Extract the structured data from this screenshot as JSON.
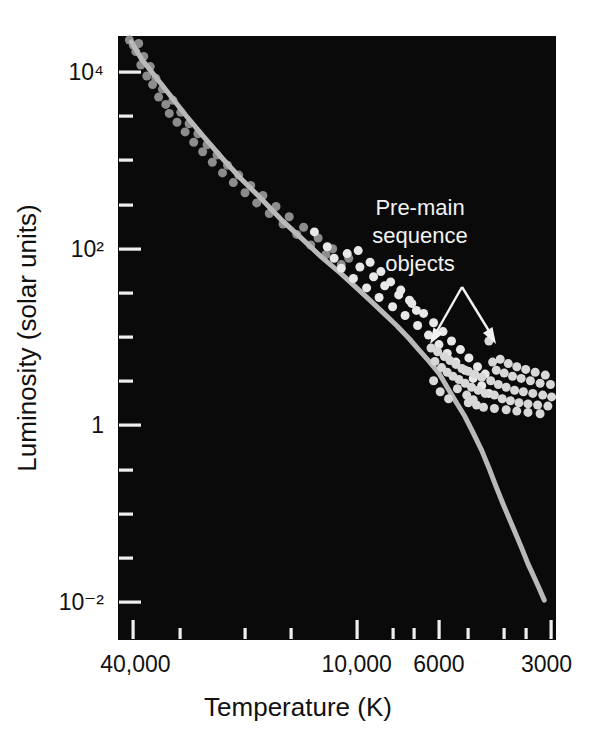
{
  "figure": {
    "background": "#ffffff",
    "plot_background": "#0a0a0a",
    "plot_border": "#0a0a0a"
  },
  "chart_data": {
    "type": "scatter",
    "title": "",
    "xlabel": "Temperature (K)",
    "ylabel": "Luminosity (solar units)",
    "xscale": "log-reversed",
    "yscale": "log",
    "xlim": [
      44000,
      2900
    ],
    "ylim": [
      0.005,
      30000
    ],
    "grid": false,
    "legend": false,
    "x_ticklabels": [
      "40,000",
      "10,000",
      "6000",
      "3000"
    ],
    "x_ticklabel_values": [
      40000,
      10000,
      6000,
      3000
    ],
    "x_minor_ticks": [
      30000,
      20000,
      15000,
      8000,
      7000,
      5000,
      4000,
      3500
    ],
    "y_ticklabels": [
      "10⁴",
      "10²",
      "1",
      "10⁻²"
    ],
    "y_ticklabel_values": [
      10000,
      100,
      1,
      0.01
    ],
    "y_minor_decades": [
      1000,
      10,
      0.1,
      0.001
    ],
    "annotations": [
      {
        "name": "pre-main-sequence-objects",
        "lines": [
          "Pre-main",
          "sequence",
          "objects"
        ],
        "color": "#f2f2f2",
        "arrows": 2
      }
    ],
    "series": [
      {
        "name": "main-sequence",
        "type": "line",
        "color": "#b9b9b9",
        "width": 5,
        "points": [
          [
            40500,
            22000
          ],
          [
            38000,
            14000
          ],
          [
            35000,
            9000
          ],
          [
            32000,
            5600
          ],
          [
            29000,
            3300
          ],
          [
            26000,
            1900
          ],
          [
            23000,
            1050
          ],
          [
            20500,
            620
          ],
          [
            18000,
            360
          ],
          [
            16000,
            215
          ],
          [
            14000,
            128
          ],
          [
            12500,
            82
          ],
          [
            11000,
            52
          ],
          [
            10000,
            36
          ],
          [
            9200,
            26
          ],
          [
            8500,
            19
          ],
          [
            7800,
            13.5
          ],
          [
            7200,
            9.5
          ],
          [
            6800,
            7.2
          ],
          [
            6400,
            5.4
          ],
          [
            6000,
            3.9
          ],
          [
            5700,
            2.7
          ],
          [
            5400,
            1.85
          ],
          [
            5100,
            1.25
          ],
          [
            4850,
            0.82
          ],
          [
            4600,
            0.52
          ],
          [
            4400,
            0.33
          ],
          [
            4200,
            0.2
          ],
          [
            4000,
            0.12
          ],
          [
            3800,
            0.072
          ],
          [
            3600,
            0.042
          ],
          [
            3450,
            0.027
          ],
          [
            3300,
            0.018
          ],
          [
            3200,
            0.0135
          ],
          [
            3120,
            0.0105
          ]
        ]
      },
      {
        "name": "stars-upper-main-sequence",
        "type": "scatter",
        "color": "#8c8c8c",
        "size": 9,
        "points": [
          [
            41000,
            23000
          ],
          [
            40000,
            20000
          ],
          [
            39400,
            17000
          ],
          [
            38700,
            21000
          ],
          [
            38200,
            12000
          ],
          [
            37500,
            15000
          ],
          [
            36800,
            9000
          ],
          [
            36000,
            11500
          ],
          [
            35500,
            7200
          ],
          [
            34800,
            8500
          ],
          [
            34200,
            5200
          ],
          [
            33400,
            6400
          ],
          [
            32700,
            4300
          ],
          [
            32000,
            3400
          ],
          [
            31300,
            4800
          ],
          [
            30500,
            2700
          ],
          [
            29800,
            3500
          ],
          [
            29000,
            2100
          ],
          [
            28300,
            2600
          ],
          [
            27500,
            1600
          ],
          [
            26800,
            2000
          ],
          [
            26000,
            1250
          ],
          [
            25300,
            1500
          ],
          [
            24500,
            950
          ],
          [
            23800,
            1150
          ],
          [
            23000,
            720
          ],
          [
            22300,
            880
          ],
          [
            21500,
            560
          ],
          [
            20800,
            680
          ],
          [
            20000,
            430
          ],
          [
            19300,
            520
          ],
          [
            18600,
            330
          ],
          [
            17900,
            400
          ],
          [
            17200,
            250
          ],
          [
            16500,
            300
          ],
          [
            15800,
            190
          ],
          [
            15200,
            230
          ],
          [
            14500,
            145
          ],
          [
            13900,
            175
          ],
          [
            13300,
            110
          ],
          [
            12700,
            132
          ],
          [
            12100,
            86
          ],
          [
            11600,
            100
          ],
          [
            11000,
            66
          ],
          [
            10500,
            78
          ]
        ]
      },
      {
        "name": "stars-mid-main-sequence",
        "type": "scatter",
        "color": "#e8e8e8",
        "size": 9,
        "points": [
          [
            13000,
            155
          ],
          [
            12000,
            105
          ],
          [
            11500,
            78
          ],
          [
            11000,
            60
          ],
          [
            10600,
            88
          ],
          [
            10200,
            46
          ],
          [
            9800,
            62
          ],
          [
            9400,
            36
          ],
          [
            9000,
            48
          ],
          [
            8700,
            28
          ],
          [
            8400,
            38
          ],
          [
            8000,
            22
          ],
          [
            7700,
            30
          ],
          [
            7400,
            17.5
          ],
          [
            7100,
            24
          ],
          [
            6850,
            13.5
          ],
          [
            6600,
            18.5
          ],
          [
            6400,
            10.5
          ],
          [
            6200,
            14.5
          ],
          [
            6000,
            8.2
          ],
          [
            5850,
            11.5
          ],
          [
            5700,
            6.5
          ],
          [
            5550,
            9.0
          ],
          [
            5400,
            5.2
          ],
          [
            5250,
            7.2
          ],
          [
            5100,
            4.2
          ],
          [
            4980,
            5.8
          ],
          [
            4850,
            3.4
          ],
          [
            4720,
            4.6
          ],
          [
            4600,
            2.8
          ],
          [
            4500,
            3.8
          ],
          [
            4400,
            2.3
          ],
          [
            9900,
            95
          ],
          [
            9200,
            70
          ],
          [
            8600,
            55
          ],
          [
            8100,
            42
          ],
          [
            7600,
            34
          ],
          [
            7200,
            26
          ],
          [
            6900,
            20
          ]
        ]
      },
      {
        "name": "pre-main-sequence-objects",
        "type": "scatter",
        "color": "#d8d8d8",
        "size": 9,
        "points": [
          [
            6300,
            7.5
          ],
          [
            6150,
            5.3
          ],
          [
            6050,
            6.8
          ],
          [
            5900,
            4.5
          ],
          [
            5800,
            6.0
          ],
          [
            5700,
            4.0
          ],
          [
            5600,
            5.4
          ],
          [
            5500,
            3.6
          ],
          [
            5400,
            4.9
          ],
          [
            5300,
            3.3
          ],
          [
            5200,
            4.4
          ],
          [
            5100,
            3.0
          ],
          [
            5000,
            4.1
          ],
          [
            4900,
            2.7
          ],
          [
            4800,
            3.8
          ],
          [
            4700,
            2.5
          ],
          [
            4600,
            3.5
          ],
          [
            4500,
            2.3
          ],
          [
            4400,
            9.0
          ],
          [
            4350,
            3.2
          ],
          [
            4300,
            5.2
          ],
          [
            4250,
            2.2
          ],
          [
            4200,
            4.2
          ],
          [
            4150,
            2.9
          ],
          [
            4100,
            5.6
          ],
          [
            4050,
            2.0
          ],
          [
            4000,
            3.9
          ],
          [
            3950,
            2.7
          ],
          [
            3900,
            5.0
          ],
          [
            3850,
            1.9
          ],
          [
            3800,
            3.6
          ],
          [
            3750,
            2.5
          ],
          [
            3700,
            4.6
          ],
          [
            3650,
            1.8
          ],
          [
            3600,
            3.4
          ],
          [
            3550,
            2.4
          ],
          [
            3500,
            4.3
          ],
          [
            3450,
            1.75
          ],
          [
            3400,
            3.2
          ],
          [
            3350,
            2.3
          ],
          [
            3300,
            4.0
          ],
          [
            3250,
            1.7
          ],
          [
            3200,
            3.0
          ],
          [
            3150,
            2.2
          ],
          [
            3100,
            3.7
          ],
          [
            3050,
            1.65
          ],
          [
            3000,
            2.9
          ],
          [
            2980,
            2.1
          ],
          [
            5000,
            1.8
          ],
          [
            4750,
            1.7
          ],
          [
            4550,
            1.6
          ],
          [
            4250,
            1.55
          ],
          [
            3950,
            1.5
          ],
          [
            3700,
            1.45
          ],
          [
            3450,
            1.4
          ],
          [
            3200,
            1.35
          ],
          [
            6200,
            3.2
          ],
          [
            5950,
            2.4
          ],
          [
            5650,
            2.0
          ],
          [
            5350,
            2.6
          ],
          [
            5050,
            2.2
          ],
          [
            4850,
            1.95
          ]
        ]
      }
    ]
  },
  "icons": {
    "arrow": "arrow-down-left-icon"
  }
}
